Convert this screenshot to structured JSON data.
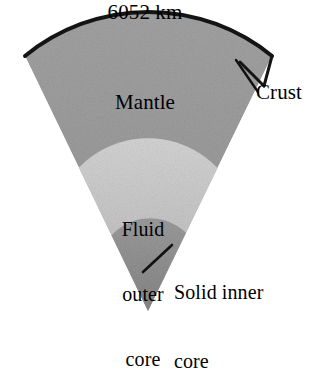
{
  "figure": {
    "background_color": "#ffffff"
  },
  "labels": {
    "diameter": "6052 km",
    "mantle": "Mantle",
    "crust": "Crust",
    "outer_core_line1": "Fluid",
    "outer_core_line2": "outer",
    "outer_core_line3": "core",
    "outer_core_full": "Fluid outer core",
    "inner_core_line1": "Solid inner",
    "inner_core_line2": "core",
    "inner_core_full": "Solid inner core"
  },
  "layers": [
    {
      "name": "crust",
      "label": "Crust",
      "color": "#1a1a1a",
      "description": "thin dark arc along outer surface"
    },
    {
      "name": "mantle",
      "label": "Mantle",
      "color": "#9a9a9a",
      "description": "medium grey wedge body"
    },
    {
      "name": "fluid-outer-core",
      "label": "Fluid outer core",
      "color": "#c9c9c9",
      "description": "light grey region below mantle"
    },
    {
      "name": "solid-inner-core",
      "label": "Solid inner core",
      "color": "#8d8d8d",
      "description": "darker grey region at wedge apex"
    }
  ],
  "measurements": {
    "diameter_value": "6052",
    "diameter_unit": "km",
    "diameter_text": "6052 km"
  },
  "colors": {
    "crust": "#1a1a1a",
    "mantle": "#9a9a9a",
    "outer_core": "#c9c9c9",
    "inner_core": "#8d8d8d",
    "leader_line": "#111111",
    "text": "#000000",
    "background": "#ffffff"
  }
}
